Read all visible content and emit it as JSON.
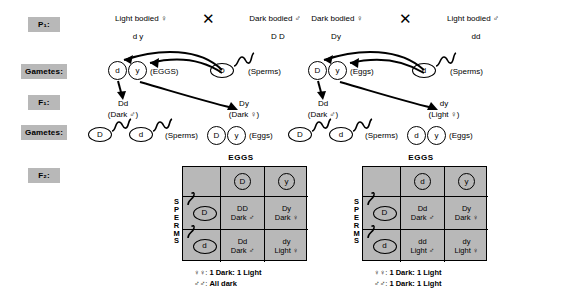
{
  "diagram": {
    "stage_labels": [
      {
        "id": "p1",
        "text": "P₁:"
      },
      {
        "id": "gametes1",
        "text": "Gametes:"
      },
      {
        "id": "f1",
        "text": "F₁:"
      },
      {
        "id": "gametes2",
        "text": "Gametes:"
      },
      {
        "id": "f2",
        "text": "F₂:"
      }
    ],
    "chip_color": "#b8b8b8",
    "cross_symbol": "✕"
  },
  "left_cross": {
    "parent_female": {
      "phenotype": "Light bodied ♀",
      "genotype": "d y"
    },
    "parent_male": {
      "phenotype": "Dark bodied ♂",
      "genotype": "D D"
    },
    "gametes_eggs": {
      "alleles": [
        "d",
        "y"
      ],
      "label": "(EGGS)"
    },
    "gametes_sperms": {
      "alleles": [
        "D"
      ],
      "label": "(Sperms)"
    },
    "f1_offspring": [
      {
        "genotype": "Dd",
        "phenotype": "(Dark ♂)"
      },
      {
        "genotype": "Dy",
        "phenotype": "(Dark ♀)"
      }
    ],
    "f1_gametes_sperms": {
      "alleles": [
        "D",
        "d"
      ],
      "label": "(Sperms)"
    },
    "f1_gametes_eggs": {
      "alleles": [
        "D",
        "y"
      ],
      "label": "(Eggs)"
    },
    "punnett": {
      "eggs_header": "EGGS",
      "sperms_header": [
        "S",
        "P",
        "E",
        "R",
        "M",
        "S"
      ],
      "col_alleles": [
        "D",
        "y"
      ],
      "row_alleles": [
        "D",
        "d"
      ],
      "cells": [
        [
          {
            "genotype": "DD",
            "phenotype": "Dark ♂"
          },
          {
            "genotype": "Dy",
            "phenotype": "Dark ♀"
          }
        ],
        [
          {
            "genotype": "Dd",
            "phenotype": "Dark ♂"
          },
          {
            "genotype": "dy",
            "phenotype": "Light ♀"
          }
        ]
      ]
    },
    "ratios": [
      {
        "sex": "♀♀:",
        "result": "1 Dark: 1 Light"
      },
      {
        "sex": "♂♂:",
        "result": "All dark"
      }
    ]
  },
  "right_cross": {
    "parent_female": {
      "phenotype": "Dark bodied ♀",
      "genotype": "Dy"
    },
    "parent_male": {
      "phenotype": "Light bodied ♂",
      "genotype": "dd"
    },
    "gametes_eggs": {
      "alleles": [
        "D",
        "y"
      ],
      "label": "(Eggs)"
    },
    "gametes_sperms": {
      "alleles": [
        "d"
      ],
      "label": "(Sperms)"
    },
    "f1_offspring": [
      {
        "genotype": "Dd",
        "phenotype": "(Dark ♂)"
      },
      {
        "genotype": "dy",
        "phenotype": "(Light ♀)"
      }
    ],
    "f1_gametes_sperms": {
      "alleles": [
        "D",
        "d"
      ],
      "label": "(Sperms)"
    },
    "f1_gametes_eggs": {
      "alleles": [
        "d",
        "y"
      ],
      "label": "(Eggs)"
    },
    "punnett": {
      "eggs_header": "EGGS",
      "sperms_header": [
        "S",
        "P",
        "E",
        "R",
        "M",
        "S"
      ],
      "col_alleles": [
        "d",
        "y"
      ],
      "row_alleles": [
        "D",
        "d"
      ],
      "cells": [
        [
          {
            "genotype": "Dd",
            "phenotype": "Dark ♂"
          },
          {
            "genotype": "Dy",
            "phenotype": "Dark ♀"
          }
        ],
        [
          {
            "genotype": "dd",
            "phenotype": "Light ♂"
          },
          {
            "genotype": "dy",
            "phenotype": "Light ♀"
          }
        ]
      ]
    },
    "ratios": [
      {
        "sex": "♀♀:",
        "result": "1 Dark: 1 Light"
      },
      {
        "sex": "♂♂:",
        "result": "1 Dark: 1 Light"
      }
    ]
  }
}
